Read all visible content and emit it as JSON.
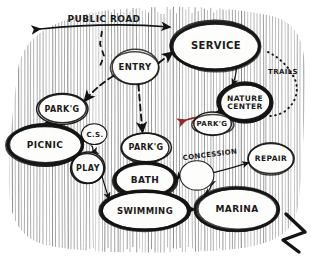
{
  "diagram": {
    "medium": "hand-drawn pen sketch",
    "background": {
      "fill_style": "vertical hatching",
      "hatch_color": "#6d6d6d",
      "paper_color": "#ffffff"
    },
    "colors": {
      "ink": "#141414",
      "hatch": "#6d6d6d",
      "accent_red": "#8d2a2a",
      "accent_magenta": "#8a2f6b"
    },
    "road": {
      "label": "PUBLIC ROAD",
      "arrow_style": "double-headed"
    },
    "trails": {
      "label": "TRAILS",
      "line_style": "dotted"
    },
    "north_arrow": {
      "name": "north-arrow-mark",
      "label": ""
    },
    "bubbles": [
      {
        "id": "entry",
        "label": "ENTRY",
        "cx": 135,
        "cy": 67,
        "rx": 24,
        "ry": 17,
        "weight": "medium",
        "font": 8.5
      },
      {
        "id": "service",
        "label": "SERVICE",
        "cx": 216,
        "cy": 46,
        "rx": 44,
        "ry": 24,
        "weight": "heavy",
        "font": 10
      },
      {
        "id": "nature-center",
        "label": "NATURE\nCENTER",
        "cx": 245,
        "cy": 103,
        "rx": 27,
        "ry": 19,
        "weight": "heavy",
        "font": 7.5
      },
      {
        "id": "parkg-nature",
        "label": "PARK'G",
        "cx": 212,
        "cy": 124,
        "rx": 20,
        "ry": 11,
        "weight": "medium",
        "font": 7
      },
      {
        "id": "parkg-west",
        "label": "PARK'G",
        "cx": 62,
        "cy": 109,
        "rx": 25,
        "ry": 15,
        "weight": "medium",
        "font": 8
      },
      {
        "id": "picnic",
        "label": "PICNIC",
        "cx": 45,
        "cy": 145,
        "rx": 38,
        "ry": 20,
        "weight": "heavy",
        "font": 9
      },
      {
        "id": "cs",
        "label": "C.S.",
        "cx": 95,
        "cy": 135,
        "rx": 12,
        "ry": 11,
        "weight": "light",
        "font": 7
      },
      {
        "id": "play",
        "label": "PLAY",
        "cx": 88,
        "cy": 168,
        "rx": 17,
        "ry": 15,
        "weight": "medium",
        "font": 8
      },
      {
        "id": "parkg-center",
        "label": "PARK'G",
        "cx": 146,
        "cy": 147,
        "rx": 25,
        "ry": 14,
        "weight": "medium",
        "font": 8
      },
      {
        "id": "bath",
        "label": "BATH",
        "cx": 145,
        "cy": 180,
        "rx": 31,
        "ry": 17,
        "weight": "heavy",
        "font": 9
      },
      {
        "id": "concession",
        "label": "CONCESSION",
        "cx": 197,
        "cy": 176,
        "rx": 17,
        "ry": 15,
        "weight": "light",
        "font": 7,
        "label_outside": true,
        "label_x": 210,
        "label_y": 155
      },
      {
        "id": "repair",
        "label": "REPAIR",
        "cx": 271,
        "cy": 159,
        "rx": 22,
        "ry": 15,
        "weight": "medium",
        "font": 7.5
      },
      {
        "id": "swimming",
        "label": "SWIMMING",
        "cx": 145,
        "cy": 211,
        "rx": 44,
        "ry": 19,
        "weight": "heavy",
        "font": 8.5
      },
      {
        "id": "marina",
        "label": "MARINA",
        "cx": 237,
        "cy": 209,
        "rx": 41,
        "ry": 21,
        "weight": "heavy",
        "font": 9
      }
    ],
    "links": [
      {
        "from": "entry",
        "to": "service",
        "style": "dashed"
      },
      {
        "from": "service",
        "to": "nature-center",
        "style": "solid"
      },
      {
        "from": "nature-center",
        "to": "parkg-nature",
        "style": "solid"
      },
      {
        "from": "entry",
        "to": "parkg-center",
        "style": "dashed"
      },
      {
        "from": "entry",
        "to": "parkg-west",
        "style": "dashed"
      },
      {
        "from": "parkg-west",
        "to": "picnic",
        "style": "solid"
      },
      {
        "from": "picnic",
        "to": "cs",
        "style": "solid"
      },
      {
        "from": "cs",
        "to": "play",
        "style": "solid"
      },
      {
        "from": "play",
        "to": "swimming",
        "style": "solid"
      },
      {
        "from": "parkg-center",
        "to": "bath",
        "style": "solid"
      },
      {
        "from": "bath",
        "to": "concession",
        "style": "solid"
      },
      {
        "from": "concession",
        "to": "repair",
        "style": "solid"
      },
      {
        "from": "bath",
        "to": "swimming",
        "style": "solid"
      },
      {
        "from": "swimming",
        "to": "marina",
        "style": "solid"
      },
      {
        "from": "concession",
        "to": "marina",
        "style": "solid"
      }
    ]
  }
}
